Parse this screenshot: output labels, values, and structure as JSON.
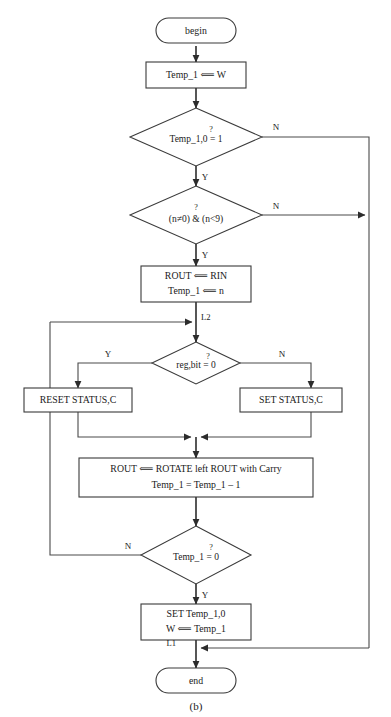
{
  "figure": {
    "caption": "(b)",
    "type": "flowchart"
  },
  "nodes": {
    "begin": {
      "label": "begin",
      "shape": "terminator"
    },
    "init": {
      "label": "Temp_1 ⟸ W",
      "shape": "process"
    },
    "decision_temp_bit": {
      "question_mark": "?",
      "label": "Temp_1,0 = 1",
      "shape": "decision"
    },
    "decision_range": {
      "question_mark": "?",
      "label": "(n≠0) & (n<9)",
      "shape": "decision"
    },
    "setup": {
      "line1": "ROUT ⟸ RIN",
      "line2": "Temp_1 ⟸ n",
      "shape": "process"
    },
    "decision_regbit": {
      "question_mark": "?",
      "label": "reg,bit = 0",
      "shape": "decision"
    },
    "reset_status": {
      "label": "RESET  STATUS,C",
      "shape": "process"
    },
    "set_status": {
      "label": "SET STATUS,C",
      "shape": "process"
    },
    "rotate": {
      "line1": "ROUT ⟸   ROTATE left ROUT with Carry",
      "line2": "Temp_1 = Temp_1 – 1",
      "shape": "process"
    },
    "decision_loop_done": {
      "question_mark": "?",
      "label": "Temp_1 = 0",
      "shape": "decision"
    },
    "finish": {
      "line1": "SET  Temp_1,0",
      "line2": "W ⟸ Temp_1",
      "shape": "process"
    },
    "end": {
      "label": "end",
      "shape": "terminator"
    }
  },
  "junctions": {
    "l2": "L2",
    "l1": "L1"
  },
  "edge_labels": {
    "temp_bit_no": "N",
    "temp_bit_yes": "Y",
    "range_no": "N",
    "range_yes": "Y",
    "regbit_yes": "Y",
    "regbit_no": "N",
    "loop_done_no": "N",
    "loop_done_yes": "Y"
  },
  "colors": {
    "stroke": "#3a3a3a",
    "connector": "#4a4a4a",
    "arrow": "#2c2c2c",
    "text": "#1a1a1a",
    "background": "#ffffff"
  }
}
